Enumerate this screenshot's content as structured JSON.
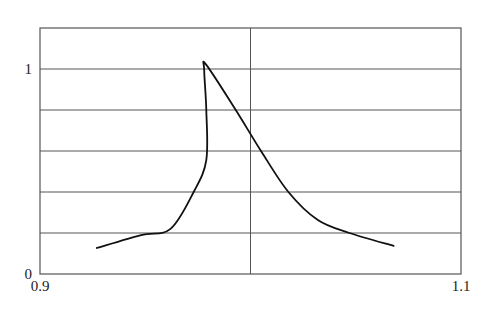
{
  "chart_data": {
    "type": "line",
    "title": "",
    "xlabel": "",
    "ylabel": "",
    "xlim": [
      0.9,
      1.1
    ],
    "ylim": [
      0,
      1.2
    ],
    "grid": true,
    "x_gridlines": [
      1.0
    ],
    "y_gridlines": [
      0.2,
      0.4,
      0.6,
      0.8,
      1.0
    ],
    "x_tick_labels": [
      {
        "value": 0.9,
        "label": "0.9"
      },
      {
        "value": 1.1,
        "label": "1.1"
      }
    ],
    "y_tick_labels": [
      {
        "value": 0,
        "label": "0"
      },
      {
        "value": 1,
        "label": "1"
      }
    ],
    "legend": null,
    "series": [
      {
        "name": "response",
        "color": "#111111",
        "x": [
          0.927,
          0.948,
          0.962,
          0.973,
          0.979,
          0.979,
          0.978,
          0.979,
          0.993,
          1.005,
          1.018,
          1.032,
          1.047,
          1.068
        ],
        "y": [
          0.127,
          0.19,
          0.22,
          0.4,
          0.556,
          0.8,
          0.995,
          1.02,
          0.8,
          0.6,
          0.4,
          0.263,
          0.2,
          0.137
        ]
      }
    ]
  },
  "style": {
    "grid_color": "#555555",
    "frame_color": "#555555",
    "line_color": "#111111"
  }
}
